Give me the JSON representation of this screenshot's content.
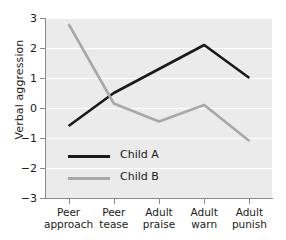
{
  "chart_data": {
    "type": "line",
    "title": "",
    "xlabel": "",
    "ylabel": "Verbal aggression",
    "categories": [
      "Peer approach",
      "Peer tease",
      "Adult praise",
      "Adult warn",
      "Adult punish"
    ],
    "category_lines": [
      [
        "Peer",
        "approach"
      ],
      [
        "Peer",
        "tease"
      ],
      [
        "Adult",
        "praise"
      ],
      [
        "Adult",
        "warn"
      ],
      [
        "Adult",
        "punish"
      ]
    ],
    "series": [
      {
        "name": "Child A",
        "color": "#1a1a1a",
        "values": [
          -0.6,
          0.5,
          1.3,
          2.1,
          1.0
        ]
      },
      {
        "name": "Child B",
        "color": "#a8a8a8",
        "values": [
          2.8,
          0.15,
          -0.45,
          0.1,
          -1.1
        ]
      }
    ],
    "ylim": [
      -3,
      3
    ],
    "yticks": [
      3,
      2,
      1,
      0,
      -1,
      -2,
      -3
    ],
    "ytick_labels": [
      "3",
      "2",
      "1",
      "0",
      "−1",
      "−2",
      "−3"
    ],
    "grid": true,
    "grid_axis": "y",
    "grid_color": "#ffffff",
    "plot_background": "#ebebeb",
    "legend_position": "inside-lower-left"
  },
  "legend": {
    "entries": [
      {
        "label": "Child A",
        "color": "#1a1a1a"
      },
      {
        "label": "Child B",
        "color": "#a8a8a8"
      }
    ]
  }
}
